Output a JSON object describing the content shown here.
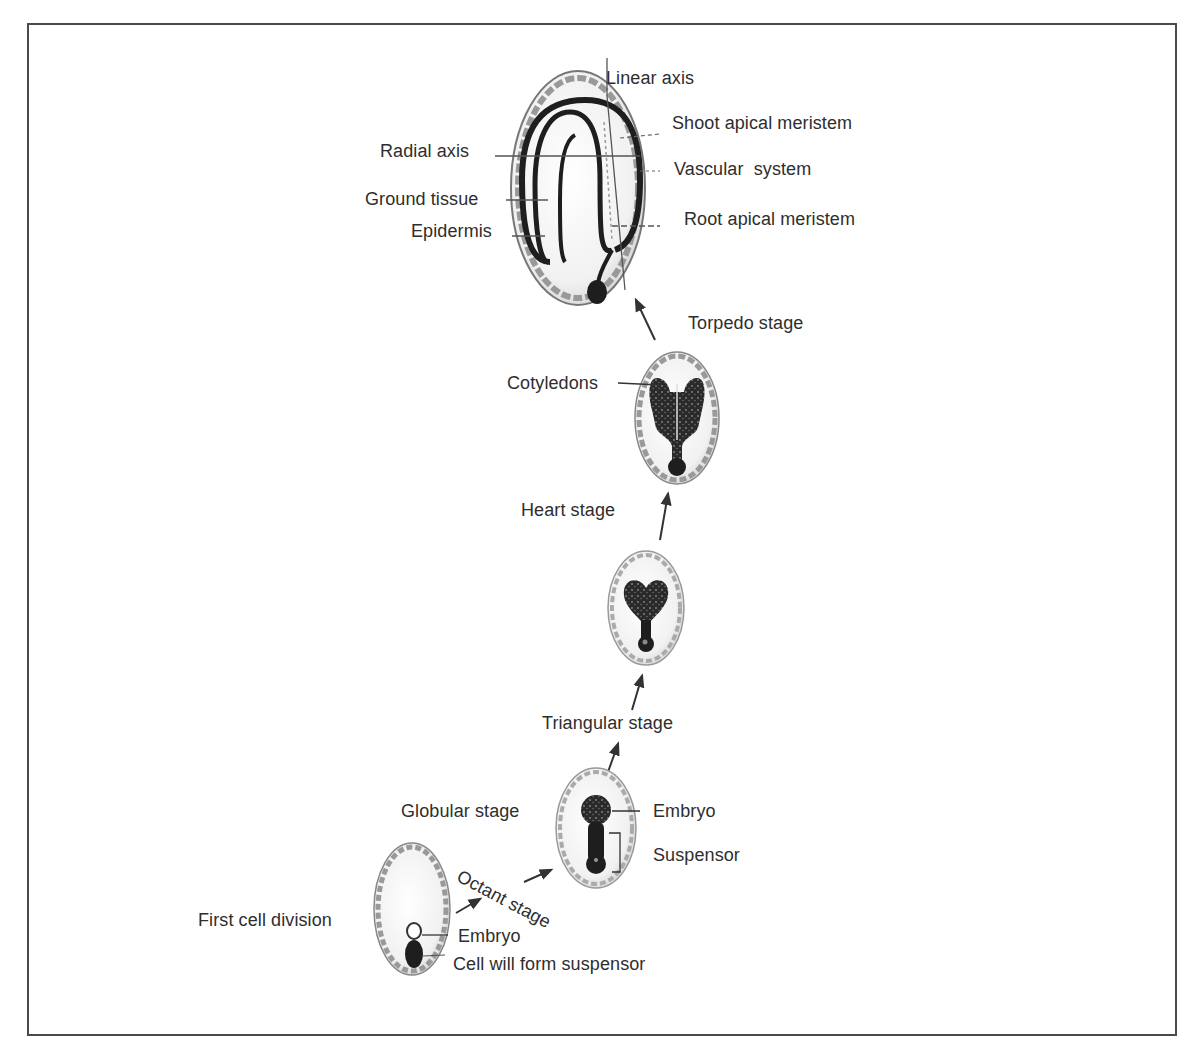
{
  "figure": {
    "stages": [
      {
        "id": "first-cell-division",
        "label": "First cell division",
        "parts": [
          "Embryo",
          "Cell will form suspensor"
        ]
      },
      {
        "id": "octant",
        "label": "Octant stage"
      },
      {
        "id": "globular",
        "label": "Globular stage",
        "parts": [
          "Embryo",
          "Suspensor"
        ]
      },
      {
        "id": "triangular",
        "label": "Triangular stage"
      },
      {
        "id": "heart",
        "label": "Heart stage"
      },
      {
        "id": "torpedo",
        "label": "Torpedo stage",
        "parts": [
          "Cotyledons"
        ]
      },
      {
        "id": "mature",
        "label": "",
        "parts": [
          "Linear axis",
          "Shoot apical meristem",
          "Radial axis",
          "Vascular system",
          "Ground tissue",
          "Root apical meristem",
          "Epidermis"
        ]
      }
    ],
    "labels": {
      "linear_axis": "Linear axis",
      "shoot_apical_meristem": "Shoot apical meristem",
      "radial_axis": "Radial axis",
      "vascular_system": "Vascular  system",
      "ground_tissue": "Ground tissue",
      "root_apical_meristem": "Root apical meristem",
      "epidermis": "Epidermis",
      "torpedo_stage": "Torpedo stage",
      "cotyledons": "Cotyledons",
      "heart_stage": "Heart stage",
      "triangular_stage": "Triangular stage",
      "globular_stage": "Globular stage",
      "globular_embryo": "Embryo",
      "suspensor": "Suspensor",
      "octant_stage": "Octant stage",
      "first_cell_division": "First cell division",
      "first_embryo": "Embryo",
      "cell_will_form_suspensor": "Cell will form suspensor"
    },
    "colors": {
      "ink": "#2b2b2b",
      "frame": "#4a4a4a",
      "seed_coat": "#8a8a8a",
      "embryo_fill": "#1e1e1e",
      "background": "#ffffff"
    }
  }
}
